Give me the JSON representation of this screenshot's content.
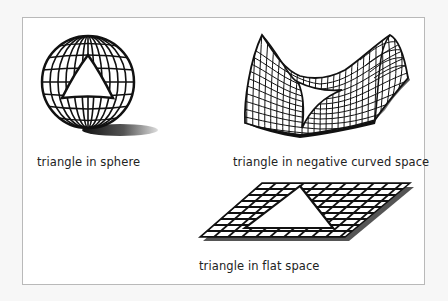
{
  "figure": {
    "panels": [
      {
        "id": "sphere",
        "label": "triangle in sphere",
        "surface": "sphere",
        "curvature": "positive"
      },
      {
        "id": "saddle",
        "label": "triangle in negative curved space",
        "surface": "saddle",
        "curvature": "negative"
      },
      {
        "id": "flat",
        "label": "triangle in flat space",
        "surface": "plane",
        "curvature": "zero"
      }
    ],
    "colors": {
      "line": "#111111",
      "shadow": "#444444",
      "background": "#ffffff",
      "frame_border": "#b9b9b9"
    }
  }
}
